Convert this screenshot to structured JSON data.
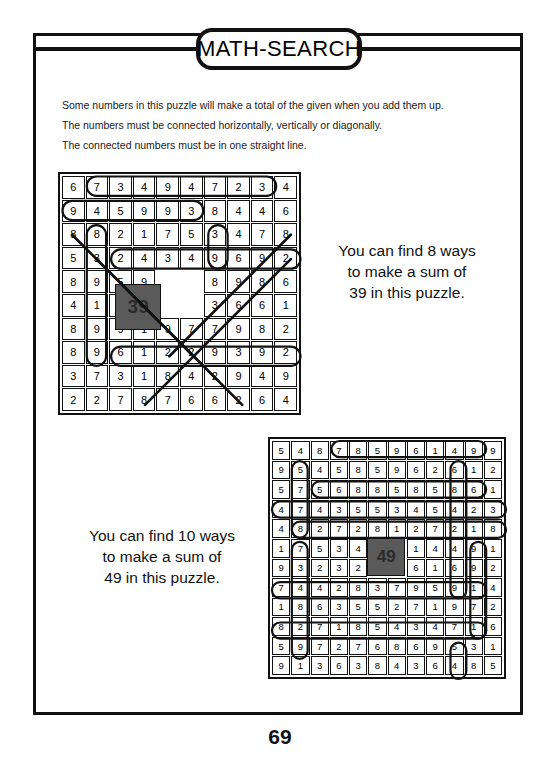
{
  "header": {
    "title": "MATH-SEARCH"
  },
  "instructions": [
    "Some numbers in this puzzle will make a total of the given when you add them up.",
    "The numbers must be connected horizontally, vertically or diagonally.",
    "The connected numbers must be in one straight line."
  ],
  "puzzles": [
    {
      "id": "puzzle-39",
      "target": "39",
      "rows": 10,
      "cols": 10,
      "target_cell": {
        "row": 5,
        "col": 5,
        "row_span": 2,
        "col_span": 2
      },
      "grid": [
        [
          6,
          7,
          3,
          4,
          9,
          4,
          7,
          2,
          3,
          4
        ],
        [
          9,
          4,
          5,
          9,
          9,
          3,
          8,
          4,
          4,
          6
        ],
        [
          8,
          8,
          2,
          1,
          7,
          5,
          3,
          4,
          7,
          8
        ],
        [
          5,
          3,
          2,
          4,
          3,
          4,
          9,
          6,
          9,
          2
        ],
        [
          8,
          9,
          5,
          9,
          null,
          null,
          8,
          9,
          8,
          6
        ],
        [
          4,
          1,
          6,
          3,
          null,
          null,
          3,
          6,
          6,
          1
        ],
        [
          8,
          9,
          9,
          1,
          9,
          7,
          7,
          9,
          8,
          2
        ],
        [
          8,
          9,
          6,
          1,
          2,
          2,
          9,
          3,
          9,
          2
        ],
        [
          3,
          7,
          3,
          1,
          8,
          4,
          2,
          9,
          4,
          9
        ],
        [
          2,
          2,
          7,
          8,
          7,
          6,
          6,
          2,
          6,
          4
        ]
      ],
      "caption": "You can find 8 ways\nto make a sum of\n39 in this puzzle.",
      "caption_lines": [
        "You can find 8 ways",
        "to make a sum of",
        "39 in this puzzle."
      ],
      "ways": 8
    },
    {
      "id": "puzzle-49",
      "target": "49",
      "rows": 12,
      "cols": 12,
      "target_cell": {
        "row": 6,
        "col": 6,
        "row_span": 2,
        "col_span": 2
      },
      "grid": [
        [
          5,
          4,
          8,
          7,
          8,
          5,
          9,
          6,
          1,
          4,
          9,
          9
        ],
        [
          9,
          5,
          4,
          5,
          8,
          5,
          9,
          6,
          2,
          6,
          1,
          2
        ],
        [
          5,
          7,
          5,
          6,
          8,
          8,
          5,
          8,
          5,
          8,
          6,
          1
        ],
        [
          4,
          7,
          4,
          3,
          5,
          5,
          3,
          4,
          5,
          4,
          2,
          3
        ],
        [
          4,
          8,
          2,
          7,
          2,
          8,
          1,
          2,
          7,
          2,
          1,
          8
        ],
        [
          1,
          7,
          5,
          3,
          4,
          null,
          null,
          1,
          4,
          4,
          9,
          1
        ],
        [
          9,
          3,
          2,
          3,
          2,
          null,
          null,
          6,
          1,
          6,
          9,
          2
        ],
        [
          7,
          4,
          4,
          2,
          8,
          3,
          7,
          9,
          5,
          9,
          1,
          4
        ],
        [
          1,
          8,
          6,
          3,
          5,
          5,
          2,
          7,
          1,
          9,
          7,
          2
        ],
        [
          8,
          2,
          7,
          1,
          8,
          5,
          4,
          3,
          4,
          7,
          1,
          6
        ],
        [
          5,
          9,
          7,
          2,
          7,
          6,
          8,
          6,
          9,
          5,
          3,
          1
        ],
        [
          9,
          1,
          3,
          6,
          3,
          8,
          4,
          3,
          6,
          4,
          8,
          5
        ]
      ],
      "caption": "You can find 10 ways\nto make a sum of\n49 in this puzzle.",
      "caption_lines": [
        "You can find 10 ways",
        "to make a sum of",
        "49 in this puzzle."
      ],
      "ways": 10
    }
  ],
  "footer": {
    "page_number": "69"
  },
  "colors": {
    "ink": "#111111",
    "paper": "#ffffff",
    "target_fill": "#5a5a5a"
  }
}
